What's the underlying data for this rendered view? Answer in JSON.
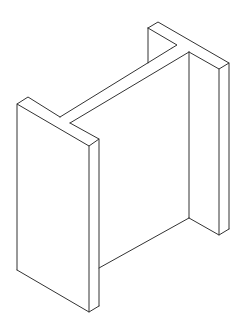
{
  "figure": {
    "line_color": "#333333",
    "background_color": "#ffffff",
    "parts": [
      "front-flange",
      "back-flange",
      "web"
    ]
  }
}
